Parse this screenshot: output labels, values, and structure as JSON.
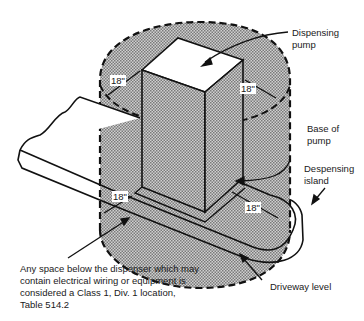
{
  "diagram": {
    "type": "technical-illustration",
    "colors": {
      "zone_fill": "#b8b8b8",
      "line": "#111111",
      "background": "#ffffff",
      "pump_top": "#ffffff"
    },
    "labels": {
      "dispensing_pump": [
        "Dispensing",
        "pump"
      ],
      "base_of_pump": [
        "Base of",
        "pump"
      ],
      "dispensing_island": [
        "Despensing",
        "island"
      ],
      "driveway_level": "Driveway level",
      "note": [
        "Any space below the dispenser which may",
        "contain electrical wiring or equipment is",
        "considered a Class 1, Div. 1 location,",
        "Table 514.2"
      ]
    },
    "dimensions": {
      "top_left": "18\"",
      "top_right": "18\"",
      "bottom_left": "18\"",
      "bottom_right": "18\""
    }
  }
}
